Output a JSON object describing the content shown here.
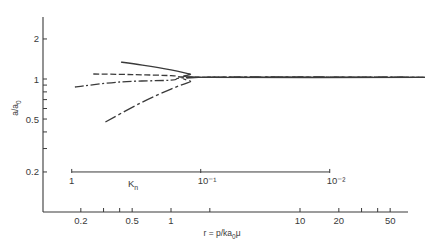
{
  "chart_data": {
    "type": "line",
    "title": "",
    "xlabel": "r = p/ka₀μ",
    "ylabel": "a/a₀",
    "xscale": "log",
    "yscale": "log",
    "xlim": [
      0.1,
      100
    ],
    "ylim": [
      0.1,
      3
    ],
    "x_ticks": [
      {
        "value": 0.2,
        "label": "0.2"
      },
      {
        "value": 0.3,
        "label": ""
      },
      {
        "value": 0.4,
        "label": ""
      },
      {
        "value": 0.5,
        "label": "0.5"
      },
      {
        "value": 1,
        "label": "1"
      },
      {
        "value": 2,
        "label": ""
      },
      {
        "value": 10,
        "label": "10"
      },
      {
        "value": 20,
        "label": "20"
      },
      {
        "value": 30,
        "label": ""
      },
      {
        "value": 40,
        "label": ""
      },
      {
        "value": 50,
        "label": "50"
      }
    ],
    "y_ticks": [
      {
        "value": 2,
        "label": "2"
      },
      {
        "value": 1,
        "label": "1"
      },
      {
        "value": 0.9,
        "label": ""
      },
      {
        "value": 0.8,
        "label": ""
      },
      {
        "value": 0.7,
        "label": ""
      },
      {
        "value": 0.6,
        "label": ""
      },
      {
        "value": 0.5,
        "label": "0.5"
      },
      {
        "value": 0.4,
        "label": ""
      },
      {
        "value": 0.3,
        "label": ""
      },
      {
        "value": 0.2,
        "label": "0.2"
      }
    ],
    "grid": false,
    "legend": null,
    "secondary_axis": {
      "label": "Kn",
      "position_y_value": 0.2,
      "ticks": [
        {
          "r": 0.17,
          "label": "1"
        },
        {
          "r": 1.7,
          "label": "10⁻¹"
        },
        {
          "r": 17,
          "label": "10⁻²"
        }
      ]
    },
    "series": [
      {
        "name": "solid (upper)",
        "style": "solid",
        "x": [
          0.41,
          0.6,
          1.0,
          1.4,
          1.8,
          93
        ],
        "y": [
          1.34,
          1.27,
          1.17,
          1.09,
          1.03,
          1.03
        ]
      },
      {
        "name": "dashed",
        "style": "dashed",
        "x": [
          0.25,
          0.5,
          1.0,
          1.8,
          93
        ],
        "y": [
          1.09,
          1.08,
          1.06,
          1.03,
          1.03
        ]
      },
      {
        "name": "dash-dot",
        "style": "dashdot",
        "x": [
          0.18,
          0.4,
          1.0,
          1.8,
          93
        ],
        "y": [
          0.87,
          0.95,
          0.98,
          1.03,
          1.03
        ]
      },
      {
        "name": "long-dash (lower)",
        "style": "longdash",
        "x": [
          0.31,
          0.58,
          1.0,
          1.4,
          1.8,
          93
        ],
        "y": [
          0.475,
          0.66,
          0.84,
          0.95,
          1.03,
          1.03
        ]
      }
    ]
  }
}
